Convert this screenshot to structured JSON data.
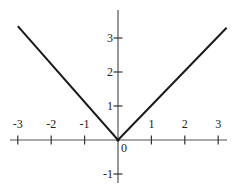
{
  "chart_data": {
    "type": "line",
    "title": "",
    "xlabel": "",
    "ylabel": "",
    "function": "y = |x|",
    "series": [
      {
        "name": "y = |x|",
        "x": [
          -3.0,
          0,
          3.25
        ],
        "y": [
          3.35,
          0,
          3.3
        ],
        "color": "#1a1a1a"
      }
    ],
    "xlim": [
      -3.2,
      3.3
    ],
    "ylim": [
      -1.3,
      3.8
    ],
    "x_ticks": [
      -3,
      -2,
      -1,
      1,
      2,
      3
    ],
    "y_ticks": [
      -1,
      1,
      2,
      3
    ],
    "x_tick_labels": [
      "-3",
      "-2",
      "-1",
      "1",
      "2",
      "3"
    ],
    "y_tick_labels": [
      "-1",
      "1",
      "2",
      "3"
    ],
    "origin_label": "0",
    "grid": false,
    "legend": null
  }
}
